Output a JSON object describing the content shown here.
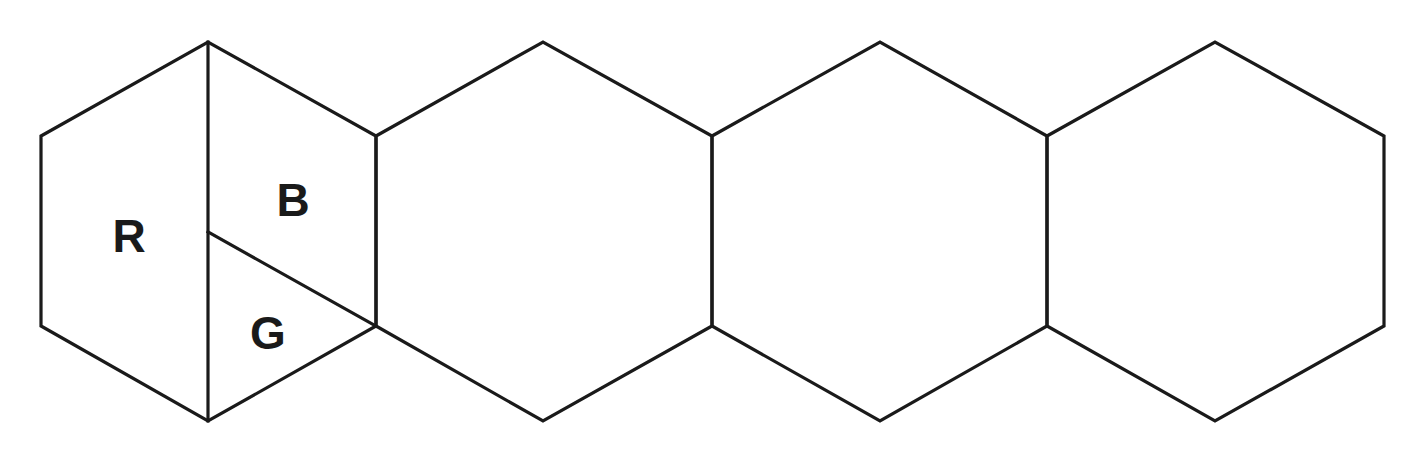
{
  "diagram": {
    "type": "hexagon-strip",
    "stroke_color": "#1a1a1a",
    "background": "#ffffff",
    "hexagons": [
      {
        "id": "hex-1",
        "points": [
          [
            41,
            136
          ],
          [
            208,
            42
          ],
          [
            376,
            136
          ],
          [
            376,
            326
          ],
          [
            208,
            421
          ],
          [
            41,
            326
          ]
        ],
        "subdivided": true,
        "dividers": [
          {
            "from": [
              208,
              42
            ],
            "to": [
              208,
              421
            ]
          },
          {
            "from": [
              208,
              232
            ],
            "to": [
              376,
              326
            ]
          }
        ],
        "regions": [
          {
            "label": "R",
            "x": 129,
            "y": 252
          },
          {
            "label": "B",
            "x": 293,
            "y": 216
          },
          {
            "label": "G",
            "x": 268,
            "y": 349
          }
        ]
      },
      {
        "id": "hex-2",
        "points": [
          [
            376,
            136
          ],
          [
            543,
            42
          ],
          [
            712,
            136
          ],
          [
            712,
            326
          ],
          [
            543,
            421
          ],
          [
            376,
            326
          ]
        ],
        "subdivided": false
      },
      {
        "id": "hex-3",
        "points": [
          [
            712,
            136
          ],
          [
            880,
            42
          ],
          [
            1047,
            136
          ],
          [
            1047,
            326
          ],
          [
            880,
            421
          ],
          [
            712,
            326
          ]
        ],
        "subdivided": false
      },
      {
        "id": "hex-4",
        "points": [
          [
            1047,
            136
          ],
          [
            1215,
            42
          ],
          [
            1384,
            136
          ],
          [
            1384,
            326
          ],
          [
            1215,
            421
          ],
          [
            1047,
            326
          ]
        ],
        "subdivided": false
      }
    ],
    "labels": {
      "r": "R",
      "b": "B",
      "g": "G"
    }
  }
}
